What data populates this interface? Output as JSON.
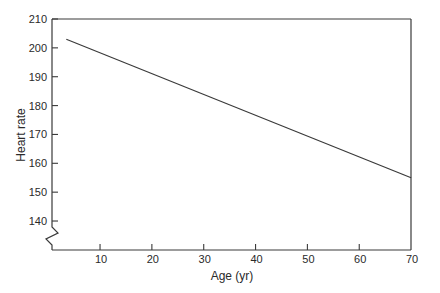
{
  "chart_data": {
    "type": "line",
    "title": "",
    "xlabel": "Age (yr)",
    "ylabel": "Heart rate",
    "xlim": [
      0,
      70
    ],
    "ylim": [
      130,
      210
    ],
    "y_axis_break": true,
    "grid": false,
    "legend": null,
    "xticks": [
      10,
      20,
      30,
      40,
      50,
      60,
      70
    ],
    "yticks": [
      140,
      150,
      160,
      170,
      180,
      190,
      200,
      210
    ],
    "series": [
      {
        "name": "Maximum heart rate",
        "x": [
          3.5,
          70
        ],
        "y": [
          203,
          155
        ]
      }
    ]
  }
}
